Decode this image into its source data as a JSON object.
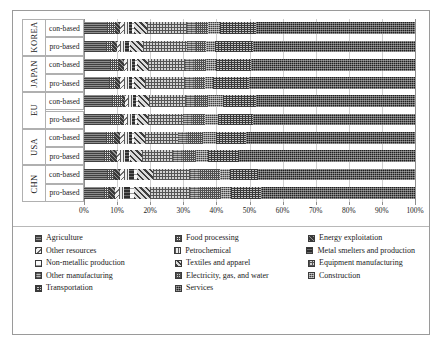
{
  "chart_data": {
    "type": "bar",
    "orientation": "horizontal",
    "stacked": true,
    "normalized_percent": true,
    "title": "",
    "xlabel": "",
    "ylabel": "",
    "xlim": [
      0,
      100
    ],
    "grid": true,
    "legend_position": "bottom",
    "xtick_labels": [
      "0%",
      "10%",
      "20%",
      "30%",
      "40%",
      "50%",
      "60%",
      "70%",
      "80%",
      "90%",
      "100%"
    ],
    "xtick_values": [
      0,
      10,
      20,
      30,
      40,
      50,
      60,
      70,
      80,
      90,
      100
    ],
    "group_labels": [
      "KOREA",
      "JAPAN",
      "EU",
      "USA",
      "CHN"
    ],
    "row_labels": [
      "con-based",
      "pro-based"
    ],
    "categories": [
      "KOREA con-based",
      "KOREA pro-based",
      "JAPAN con-based",
      "JAPAN pro-based",
      "EU con-based",
      "EU pro-based",
      "USA con-based",
      "USA pro-based",
      "CHN con-based",
      "CHN pro-based"
    ],
    "series": [
      {
        "name": "Agriculture",
        "key": "agriculture",
        "values": [
          7.0,
          6.5,
          8.0,
          7.5,
          8.5,
          8.0,
          6.5,
          6.0,
          7.0,
          6.0
        ]
      },
      {
        "name": "Food processing",
        "key": "food",
        "values": [
          2.5,
          2.0,
          2.5,
          2.0,
          3.0,
          3.0,
          2.5,
          2.0,
          2.0,
          1.5
        ]
      },
      {
        "name": "Energy exploitation",
        "key": "energy",
        "values": [
          1.5,
          1.5,
          1.5,
          1.5,
          1.0,
          1.0,
          2.0,
          2.0,
          2.0,
          2.0
        ]
      },
      {
        "name": "Other resources",
        "key": "otherres",
        "values": [
          1.0,
          1.0,
          1.0,
          1.0,
          1.0,
          1.0,
          1.0,
          1.0,
          1.0,
          1.0
        ]
      },
      {
        "name": "Petrochemical",
        "key": "petro",
        "values": [
          1.5,
          1.5,
          1.5,
          1.5,
          1.5,
          1.5,
          1.5,
          1.5,
          1.5,
          1.5
        ]
      },
      {
        "name": "Metal smelters and production",
        "key": "metal",
        "values": [
          1.0,
          1.0,
          1.0,
          1.0,
          1.0,
          1.0,
          1.0,
          1.0,
          1.5,
          2.0
        ]
      },
      {
        "name": "Non-metallic production",
        "key": "nonmetal",
        "values": [
          0.5,
          0.5,
          0.5,
          0.5,
          0.5,
          0.5,
          0.5,
          0.5,
          1.0,
          1.0
        ]
      },
      {
        "name": "Textiles and apparel",
        "key": "textiles",
        "values": [
          4.0,
          4.0,
          3.5,
          3.5,
          3.5,
          3.5,
          3.5,
          3.5,
          5.0,
          5.0
        ]
      },
      {
        "name": "Equipment manufacturing",
        "key": "equipment",
        "values": [
          12.0,
          13.0,
          11.0,
          12.0,
          11.0,
          10.5,
          10.0,
          9.5,
          11.0,
          12.0
        ]
      },
      {
        "name": "Other manufacturing",
        "key": "othermfg",
        "values": [
          3.0,
          3.0,
          3.0,
          3.0,
          3.0,
          3.0,
          3.0,
          3.0,
          3.0,
          3.0
        ]
      },
      {
        "name": "Electricity, gas, and water",
        "key": "electricity",
        "values": [
          3.5,
          3.0,
          3.5,
          3.0,
          4.0,
          3.5,
          4.5,
          4.0,
          6.0,
          6.5
        ]
      },
      {
        "name": "Construction",
        "key": "construction",
        "values": [
          3.5,
          2.5,
          3.0,
          2.5,
          4.5,
          4.0,
          4.0,
          3.5,
          3.0,
          3.0
        ]
      },
      {
        "name": "Transportation",
        "key": "transportation",
        "values": [
          11.0,
          11.5,
          10.5,
          11.0,
          10.0,
          10.5,
          9.0,
          9.5,
          8.5,
          9.0
        ]
      },
      {
        "name": "Services",
        "key": "services",
        "values": [
          48.0,
          49.0,
          49.5,
          50.0,
          48.5,
          49.0,
          51.0,
          53.0,
          47.5,
          46.5
        ]
      }
    ]
  },
  "legend": {
    "columns": [
      [
        {
          "label": "Agriculture",
          "key": "agriculture"
        },
        {
          "label": "Other resources",
          "key": "otherres"
        },
        {
          "label": "Non-metallic production",
          "key": "nonmetal"
        },
        {
          "label": "Other manufacturing",
          "key": "othermfg"
        },
        {
          "label": "Transportation",
          "key": "transportation"
        }
      ],
      [
        {
          "label": "Food processing",
          "key": "food"
        },
        {
          "label": "Petrochemical",
          "key": "petro"
        },
        {
          "label": "Textiles and apparel",
          "key": "textiles"
        },
        {
          "label": "Electricity, gas, and water",
          "key": "electricity"
        },
        {
          "label": "Services",
          "key": "services"
        }
      ],
      [
        {
          "label": "Energy exploitation",
          "key": "energy"
        },
        {
          "label": "Metal smelters and production",
          "key": "metal"
        },
        {
          "label": "Equipment manufacturing",
          "key": "equipment"
        },
        {
          "label": "Construction",
          "key": "construction"
        }
      ]
    ]
  }
}
